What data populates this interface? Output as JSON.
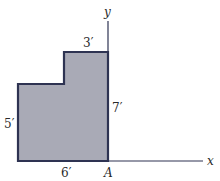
{
  "diagram": {
    "type": "composite-area-figure",
    "axes": {
      "x_label": "x",
      "y_label": "y",
      "origin_label": "A"
    },
    "dimensions": {
      "top_width": "3′",
      "right_height": "7′",
      "left_height": "5′",
      "bottom_width": "6′"
    },
    "colors": {
      "fill": "#a9aab6",
      "stroke": "#2e3352",
      "axis": "#2e3352",
      "background": "#ffffff"
    }
  }
}
